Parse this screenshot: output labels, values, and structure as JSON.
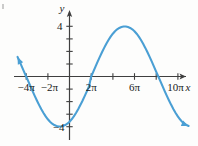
{
  "figure": {
    "name": "sine-graph",
    "background_color": "#fdfdfc",
    "curve_color": "#4a9fd4",
    "axis_color": "#3f3f3f",
    "text_color": "#1a1a1a"
  },
  "axes": {
    "x_axis_label": "x",
    "y_axis_label": "y",
    "x_tick_labels": [
      "−4π",
      "−2π",
      "2π",
      "6π",
      "10π"
    ],
    "y_tick_labels": [
      "4",
      "−4"
    ]
  },
  "chart_data": {
    "type": "line",
    "title": "",
    "xlabel": "x",
    "ylabel": "y",
    "grid": false,
    "legend": "none",
    "function": "y = 4 sin(x/4)",
    "amplitude": 4,
    "period": "8π",
    "xlim": [
      "-5π",
      "11.5π"
    ],
    "ylim": [
      -5.2,
      5.2
    ],
    "x_ticks": [
      -4,
      -2,
      2,
      6,
      10
    ],
    "x_tick_labels": [
      "−4π",
      "−2π",
      "2π",
      "6π",
      "10π"
    ],
    "y_ticks": [
      -4,
      -3,
      -2,
      -1,
      1,
      2,
      3,
      4
    ],
    "y_labeled_ticks": [
      4,
      -4
    ],
    "zeros_in_pi": [
      -4,
      0,
      4,
      8
    ],
    "maxima": [
      {
        "x_in_pi": 2,
        "y": 4
      },
      {
        "x_in_pi": 10,
        "y": 4
      }
    ],
    "minima": [
      {
        "x_in_pi": -2,
        "y": -4
      },
      {
        "x_in_pi": 6,
        "y": -4
      }
    ],
    "series": [
      {
        "name": "y = 4 sin(x/4)",
        "color": "#4a9fd4",
        "x_in_pi": [
          -4.8,
          -4.6,
          -4.4,
          -4.2,
          -4.0,
          -3.8,
          -3.6,
          -3.4,
          -3.2,
          -3.0,
          -2.8,
          -2.6,
          -2.4,
          -2.2,
          -2.0,
          -1.8,
          -1.6,
          -1.4,
          -1.2,
          -1.0,
          -0.8,
          -0.6,
          -0.4,
          -0.2,
          0.0,
          0.2,
          0.4,
          0.6,
          0.8,
          1.0,
          1.2,
          1.4,
          1.6,
          1.8,
          2.0,
          2.2,
          2.4,
          2.6,
          2.8,
          3.0,
          3.2,
          3.4,
          3.6,
          3.8,
          4.0,
          4.2,
          4.4,
          4.6,
          4.8,
          5.0,
          5.2,
          5.4,
          5.6,
          5.8,
          6.0,
          6.2,
          6.4,
          6.6,
          6.8,
          7.0,
          7.2,
          7.4,
          7.6,
          7.8,
          8.0,
          8.2,
          8.4,
          8.6,
          8.8,
          9.0,
          9.2,
          9.4,
          9.6,
          9.8,
          10.0,
          10.2,
          10.4,
          10.6,
          10.8,
          11.0
        ],
        "y": [
          1.56,
          1.18,
          0.79,
          0.39,
          0.0,
          -0.39,
          -0.79,
          -1.18,
          -1.56,
          -1.93,
          -2.28,
          -2.61,
          -2.91,
          -3.18,
          -3.41,
          -3.61,
          -3.76,
          -3.87,
          -3.94,
          -3.98,
          -3.98,
          -3.94,
          -3.87,
          -3.76,
          -3.61,
          -3.41,
          -3.18,
          -2.91,
          -2.61,
          -2.28,
          -1.93,
          -1.56,
          -1.18,
          -0.79,
          0.0,
          0.39,
          0.79,
          1.18,
          1.56,
          1.93,
          2.28,
          2.61,
          2.91,
          3.18,
          3.41,
          3.61,
          3.76,
          3.87,
          3.94,
          3.98,
          3.98,
          3.94,
          3.87,
          3.76,
          3.61,
          3.41,
          3.18,
          2.91,
          2.61,
          2.28,
          1.93,
          1.56,
          1.18,
          0.79,
          0.39,
          0.0,
          -0.39,
          -0.79,
          -1.18,
          -1.56,
          -1.93,
          -2.28,
          -2.61,
          -2.91,
          -3.18,
          -3.41,
          -3.61,
          -3.76,
          -3.87,
          -3.94
        ],
        "left_endpoint_arrow": true,
        "right_endpoint_arrow": true
      }
    ]
  }
}
